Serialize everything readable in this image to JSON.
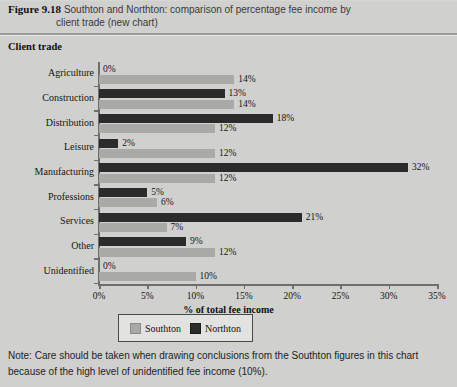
{
  "figure": {
    "number": "Figure 9.18",
    "caption_line1": "Southton and Northton: comparison of percentage fee income by",
    "caption_line2": "client trade (new chart)"
  },
  "axis_title": "Client trade",
  "legend": {
    "southton_label": "Southton",
    "northton_label": "Northton"
  },
  "note": "Note: Care should be taken when drawing conclusions from the Southton figures in this chart because of the high level of unidentified fee income (10%).",
  "colors": {
    "southton": "#a9a9a7",
    "northton": "#2b2b2b",
    "background": "#d3d3d1",
    "axis": "#6e6e6c"
  },
  "chart_data": {
    "type": "bar",
    "orientation": "horizontal",
    "title": "Southton and Northton: comparison of percentage fee income by client trade (new chart)",
    "xlabel": "% of total fee income",
    "ylabel": "Client trade",
    "xlim": [
      0,
      35
    ],
    "xticks": [
      0,
      5,
      10,
      15,
      20,
      25,
      30,
      35
    ],
    "xticklabels": [
      "0%",
      "5%",
      "10%",
      "15%",
      "20%",
      "25%",
      "30%",
      "35%"
    ],
    "grid": false,
    "legend_position": "bottom",
    "categories": [
      "Agriculture",
      "Construction",
      "Distribution",
      "Leisure",
      "Manufacturing",
      "Professions",
      "Services",
      "Other",
      "Unidentified"
    ],
    "series": [
      {
        "name": "Northton",
        "color": "#2b2b2b",
        "values": [
          0,
          13,
          18,
          2,
          32,
          5,
          21,
          9,
          0
        ],
        "labels": [
          "0%",
          "13%",
          "18%",
          "2%",
          "32%",
          "5%",
          "21%",
          "9%",
          "0%"
        ]
      },
      {
        "name": "Southton",
        "color": "#a9a9a7",
        "values": [
          14,
          14,
          12,
          12,
          12,
          6,
          7,
          12,
          10
        ],
        "labels": [
          "14%",
          "14%",
          "12%",
          "12%",
          "12%",
          "6%",
          "7%",
          "12%",
          "10%"
        ]
      }
    ]
  }
}
